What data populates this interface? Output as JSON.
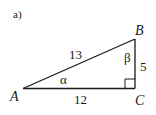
{
  "figure_label": "a)",
  "triangle": {
    "vertices": {
      "A": "A",
      "B": "B",
      "C": "C"
    },
    "sides": {
      "hypotenuse_AB": "13",
      "adjacent_AC": "12",
      "opposite_BC": "5"
    },
    "angles": {
      "at_A": "α",
      "at_B": "β"
    },
    "right_angle_at": "C",
    "stroke_color": "#1a1a1a"
  }
}
